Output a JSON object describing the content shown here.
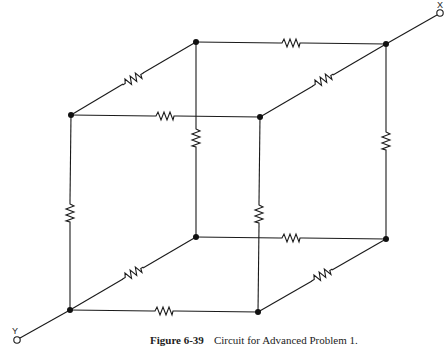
{
  "figure": {
    "number": "Figure 6-39",
    "title": "Circuit for Advanced Problem 1."
  },
  "terminals": {
    "x_label": "X",
    "y_label": "Y"
  },
  "circuit": {
    "type": "resistor cube",
    "nodes": 8,
    "resistors": 12,
    "terminal_x_node": "back-top-right",
    "terminal_y_node": "front-bottom-left"
  },
  "colors": {
    "line": "#1a1a1a",
    "background": "#ffffff"
  }
}
